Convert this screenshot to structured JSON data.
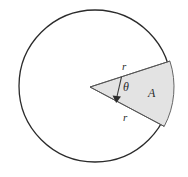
{
  "figure": {
    "labels": {
      "radius_upper": "r",
      "radius_lower": "r",
      "angle": "θ",
      "area": "A"
    },
    "colors": {
      "circle_stroke": "#2b2b2b",
      "circle_fill": "#ffffff",
      "sector_fill": "#e3e3e3",
      "sector_stroke": "#555555",
      "label_color": "#2b2b2b",
      "background": "#ffffff"
    },
    "geometry": {
      "circle_center_x": 95,
      "circle_center_y": 86,
      "circle_radius": 76,
      "sector_apex_x": 90,
      "sector_apex_y": 87,
      "sector_start_angle_deg": -18,
      "sector_end_angle_deg": 28,
      "sector_radius": 84
    }
  }
}
